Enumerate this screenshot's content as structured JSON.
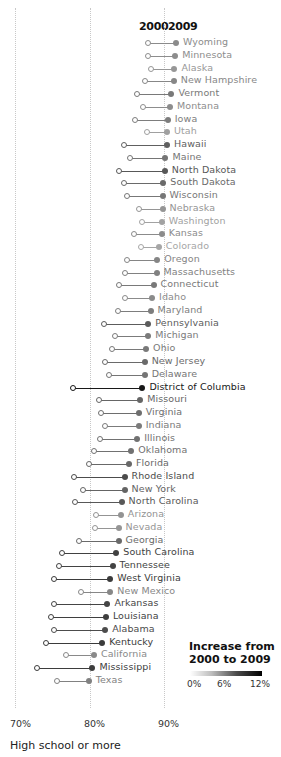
{
  "chart_data": {
    "type": "dumbbell",
    "title": "",
    "xlabel": "High school or more",
    "ylabel": "",
    "xlim": [
      68,
      97
    ],
    "x_ticks": [
      "70%",
      "80%",
      "90%"
    ],
    "x_tick_values": [
      70,
      80,
      90
    ],
    "grid": true,
    "series_labels": {
      "start": "2000",
      "end": "2009"
    },
    "legend": {
      "title": "Increase from 2000 to 2009",
      "scale_labels": [
        "0%",
        "6%",
        "12%"
      ],
      "scale_range": [
        0,
        12
      ],
      "position": "bottom-right"
    },
    "rows": [
      {
        "state": "Wyoming",
        "y2000": 87.9,
        "y2009": 91.6
      },
      {
        "state": "Minnesota",
        "y2000": 87.9,
        "y2009": 91.5
      },
      {
        "state": "Alaska",
        "y2000": 88.3,
        "y2009": 91.4
      },
      {
        "state": "New Hampshire",
        "y2000": 87.4,
        "y2009": 91.3
      },
      {
        "state": "Vermont",
        "y2000": 86.4,
        "y2009": 91.0
      },
      {
        "state": "Montana",
        "y2000": 87.2,
        "y2009": 90.8
      },
      {
        "state": "Iowa",
        "y2000": 86.1,
        "y2009": 90.5
      },
      {
        "state": "Utah",
        "y2000": 87.7,
        "y2009": 90.4
      },
      {
        "state": "Hawaii",
        "y2000": 84.6,
        "y2009": 90.4
      },
      {
        "state": "Maine",
        "y2000": 85.4,
        "y2009": 90.2
      },
      {
        "state": "North Dakota",
        "y2000": 83.9,
        "y2009": 90.1
      },
      {
        "state": "South Dakota",
        "y2000": 84.6,
        "y2009": 89.9
      },
      {
        "state": "Wisconsin",
        "y2000": 85.1,
        "y2009": 89.8
      },
      {
        "state": "Nebraska",
        "y2000": 86.6,
        "y2009": 89.8
      },
      {
        "state": "Washington",
        "y2000": 87.1,
        "y2009": 89.7
      },
      {
        "state": "Kansas",
        "y2000": 86.0,
        "y2009": 89.7
      },
      {
        "state": "Colorado",
        "y2000": 86.9,
        "y2009": 89.3
      },
      {
        "state": "Oregon",
        "y2000": 85.1,
        "y2009": 89.1
      },
      {
        "state": "Massachusetts",
        "y2000": 84.8,
        "y2009": 89.0
      },
      {
        "state": "Connecticut",
        "y2000": 84.0,
        "y2009": 88.6
      },
      {
        "state": "Idaho",
        "y2000": 84.7,
        "y2009": 88.4
      },
      {
        "state": "Maryland",
        "y2000": 83.8,
        "y2009": 88.2
      },
      {
        "state": "Pennsylvania",
        "y2000": 81.9,
        "y2009": 87.9
      },
      {
        "state": "Michigan",
        "y2000": 83.4,
        "y2009": 87.9
      },
      {
        "state": "Ohio",
        "y2000": 83.0,
        "y2009": 87.6
      },
      {
        "state": "New Jersey",
        "y2000": 82.1,
        "y2009": 87.4
      },
      {
        "state": "Delaware",
        "y2000": 82.6,
        "y2009": 87.4
      },
      {
        "state": "District of Columbia",
        "y2000": 77.8,
        "y2009": 87.1
      },
      {
        "state": "Missouri",
        "y2000": 81.3,
        "y2009": 86.8
      },
      {
        "state": "Virginia",
        "y2000": 81.5,
        "y2009": 86.6
      },
      {
        "state": "Indiana",
        "y2000": 82.1,
        "y2009": 86.6
      },
      {
        "state": "Illinois",
        "y2000": 81.4,
        "y2009": 86.4
      },
      {
        "state": "Oklahoma",
        "y2000": 80.6,
        "y2009": 85.6
      },
      {
        "state": "Florida",
        "y2000": 79.9,
        "y2009": 85.3
      },
      {
        "state": "Rhode Island",
        "y2000": 77.9,
        "y2009": 84.7
      },
      {
        "state": "New York",
        "y2000": 79.1,
        "y2009": 84.7
      },
      {
        "state": "North Carolina",
        "y2000": 78.1,
        "y2009": 84.3
      },
      {
        "state": "Arizona",
        "y2000": 80.9,
        "y2009": 84.2
      },
      {
        "state": "Nevada",
        "y2000": 80.7,
        "y2009": 83.9
      },
      {
        "state": "Georgia",
        "y2000": 78.6,
        "y2009": 83.9
      },
      {
        "state": "South Carolina",
        "y2000": 76.3,
        "y2009": 83.6
      },
      {
        "state": "Tennessee",
        "y2000": 75.9,
        "y2009": 83.1
      },
      {
        "state": "West Virginia",
        "y2000": 75.2,
        "y2009": 82.8
      },
      {
        "state": "New Mexico",
        "y2000": 78.9,
        "y2009": 82.8
      },
      {
        "state": "Arkansas",
        "y2000": 75.3,
        "y2009": 82.4
      },
      {
        "state": "Louisiana",
        "y2000": 74.8,
        "y2009": 82.2
      },
      {
        "state": "Alabama",
        "y2000": 75.3,
        "y2009": 82.1
      },
      {
        "state": "Kentucky",
        "y2000": 74.1,
        "y2009": 81.7
      },
      {
        "state": "California",
        "y2000": 76.8,
        "y2009": 80.6
      },
      {
        "state": "Mississippi",
        "y2000": 72.9,
        "y2009": 80.4
      },
      {
        "state": "Texas",
        "y2000": 75.7,
        "y2009": 79.9
      }
    ]
  },
  "header": {
    "start_year": "2000",
    "end_year": "2009"
  },
  "axis": {
    "ticks": [
      {
        "label": "70%",
        "value": 70
      },
      {
        "label": "80%",
        "value": 80
      },
      {
        "label": "90%",
        "value": 90
      }
    ],
    "title": "High school or more"
  },
  "legend": {
    "title": "Increase from 2000 to 2009",
    "labels": {
      "min": "0%",
      "mid": "6%",
      "max": "12%"
    }
  }
}
